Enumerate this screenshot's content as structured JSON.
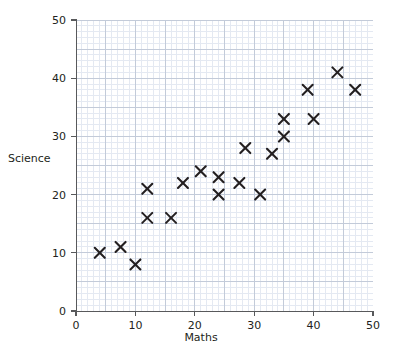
{
  "chart_data": {
    "type": "scatter",
    "title": "",
    "xlabel": "Maths",
    "ylabel": "Science",
    "xlim": [
      0,
      50
    ],
    "ylim": [
      0,
      50
    ],
    "xticks": [
      0,
      10,
      20,
      30,
      40,
      50
    ],
    "yticks": [
      0,
      10,
      20,
      30,
      40,
      50
    ],
    "xtick_labels": [
      "0",
      "10",
      "20",
      "30",
      "40",
      "50"
    ],
    "ytick_labels": [
      "0",
      "10",
      "20",
      "30",
      "40",
      "50"
    ],
    "grid": true,
    "grid_minor_step": 1,
    "grid_major_step": 5,
    "legend": "none",
    "marker": "x",
    "marker_color": "#231f20",
    "points": [
      {
        "x": 4,
        "y": 10
      },
      {
        "x": 7.5,
        "y": 11
      },
      {
        "x": 10,
        "y": 8
      },
      {
        "x": 12,
        "y": 21
      },
      {
        "x": 12,
        "y": 16
      },
      {
        "x": 16,
        "y": 16
      },
      {
        "x": 18,
        "y": 22
      },
      {
        "x": 21,
        "y": 24
      },
      {
        "x": 24,
        "y": 23
      },
      {
        "x": 24,
        "y": 20
      },
      {
        "x": 27.5,
        "y": 22
      },
      {
        "x": 28.5,
        "y": 28
      },
      {
        "x": 31,
        "y": 20
      },
      {
        "x": 33,
        "y": 27
      },
      {
        "x": 35,
        "y": 30
      },
      {
        "x": 35,
        "y": 33
      },
      {
        "x": 39,
        "y": 38
      },
      {
        "x": 40,
        "y": 33
      },
      {
        "x": 44,
        "y": 41
      },
      {
        "x": 47,
        "y": 38
      }
    ]
  },
  "colors": {
    "axis": "#58595b",
    "text": "#231f20",
    "grid_minor": "#e4e9f2",
    "grid_major": "#c3cbd9",
    "marker": "#231f20",
    "background": "#ffffff"
  }
}
